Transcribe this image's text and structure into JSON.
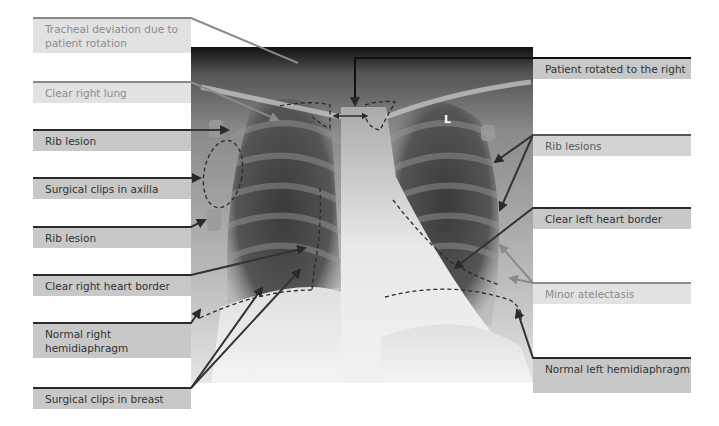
{
  "figure": {
    "image_marker": "L",
    "colors": {
      "label_light_bg": "#e2e2e2",
      "label_mid_bg": "#d3d3d3",
      "label_dark_bg": "#c8c8c8",
      "annotation_line": "#2a2a2a",
      "annotation_line_light": "#8a8a8a"
    }
  },
  "labels_left": [
    {
      "text": "Tracheal deviation due to patient rotation",
      "tone": "light"
    },
    {
      "text": "Clear right lung",
      "tone": "light"
    },
    {
      "text": "Rib lesion",
      "tone": "dark"
    },
    {
      "text": "Surgical clips in axilla",
      "tone": "dark"
    },
    {
      "text": "Rib lesion",
      "tone": "dark"
    },
    {
      "text": "Clear right heart border",
      "tone": "dark"
    },
    {
      "text": "Normal right hemidiaphragm",
      "tone": "dark"
    },
    {
      "text": "Surgical clips in breast",
      "tone": "dark"
    }
  ],
  "labels_right": [
    {
      "text": "Patient rotated to the right",
      "tone": "dark"
    },
    {
      "text": "Rib lesions",
      "tone": "mid"
    },
    {
      "text": "Clear left heart border",
      "tone": "dark"
    },
    {
      "text": "Minor atelectasis",
      "tone": "light"
    },
    {
      "text": "Normal left hemidiaphragm",
      "tone": "dark"
    }
  ]
}
